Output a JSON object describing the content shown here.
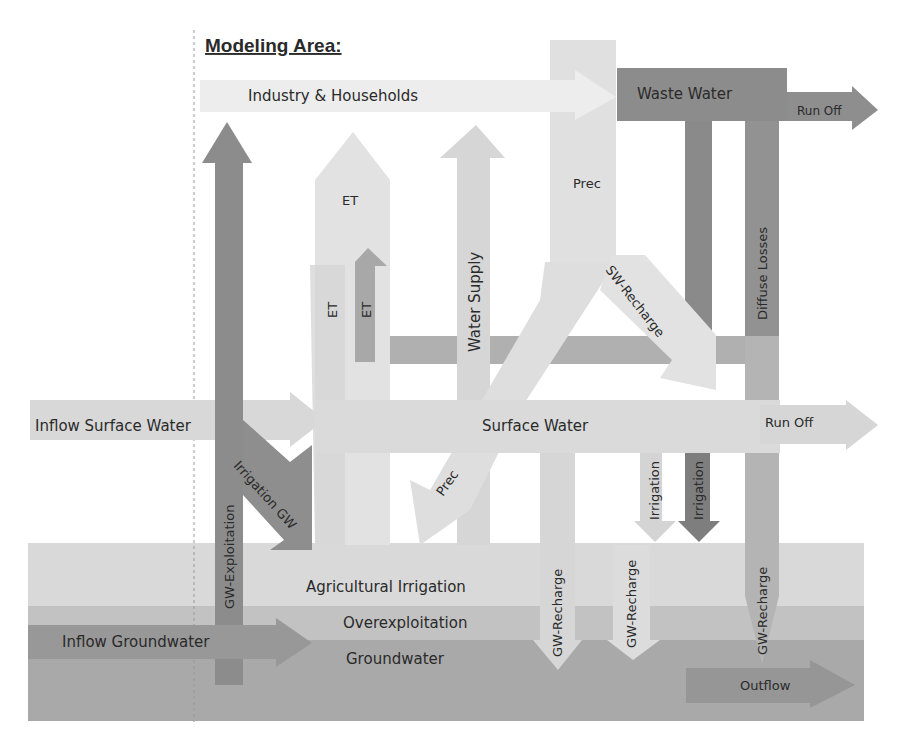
{
  "title": "Modeling Area:",
  "colors": {
    "very_light": "#ececec",
    "light": "#dedede",
    "light_mid": "#d2d2d2",
    "mid": "#b4b4b4",
    "mid_dark": "#a2a2a2",
    "dark": "#8e8e8e",
    "darker": "#7e7e7e",
    "groundwater": "#a9a9a9",
    "overexploitation": "#c4c4c4",
    "agri": "#d9d9d9"
  },
  "nodes": {
    "industry": "Industry & Households",
    "waste_water": "Waste Water",
    "surface_water": "Surface Water",
    "agricultural_irrigation": "Agricultural Irrigation",
    "overexploitation": "Overexploitation",
    "groundwater": "Groundwater"
  },
  "flows": {
    "run_off_top": "Run Off",
    "run_off_mid": "Run Off",
    "et_top": "ET",
    "et_left": "ET",
    "et_right": "ET",
    "water_supply": "Water Supply",
    "prec_top": "Prec",
    "prec_diag": "Prec",
    "sw_recharge": "SW-Recharge",
    "diffuse_losses": "Diffuse Losses",
    "inflow_surface_water": "Inflow Surface Water",
    "irrigation_gw": "Irrigation GW",
    "gw_exploitation": "GW-Exploitation",
    "irrigation_light": "Irrigation",
    "irrigation_dark": "Irrigation",
    "gw_recharge_1": "GW-Recharge",
    "gw_recharge_2": "GW-Recharge",
    "gw_recharge_3": "GW-Recharge",
    "inflow_groundwater": "Inflow Groundwater",
    "outflow": "Outflow"
  }
}
